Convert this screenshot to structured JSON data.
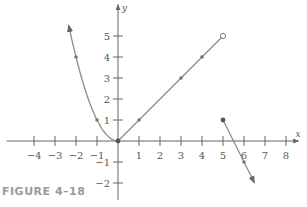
{
  "caption": "FIGURE 4–18",
  "colors": {
    "axis": "#666666",
    "curve": "#8a8a8a",
    "point": "#777777",
    "caption": "#9a9a9a"
  },
  "chart_data": {
    "type": "line",
    "title": "",
    "xlabel": "x",
    "ylabel": "y",
    "xlim": [
      -5.3,
      8.6
    ],
    "ylim": [
      -2.8,
      6.5
    ],
    "grid": false,
    "x_ticks": [
      -4,
      -3,
      -2,
      -1,
      1,
      2,
      3,
      4,
      5,
      6,
      7,
      8
    ],
    "y_ticks": [
      -2,
      -1,
      1,
      2,
      3,
      4,
      5
    ],
    "series": [
      {
        "name": "y = x^2 (x <= 0)",
        "kind": "curve",
        "domain": [
          -2.35,
          0
        ],
        "arrow_start": true,
        "marked_points": [
          [
            -2,
            4
          ],
          [
            -1,
            1
          ]
        ]
      },
      {
        "name": "y = x (0 <= x < 5)",
        "kind": "segment",
        "from": [
          0,
          0
        ],
        "to": [
          5,
          5
        ],
        "end_open": true,
        "marked_points": [
          [
            1,
            1
          ],
          [
            3,
            3
          ],
          [
            4,
            4
          ]
        ]
      },
      {
        "name": "y = -2x + 11 (x >= 5)",
        "kind": "ray",
        "from": [
          5,
          1
        ],
        "to": [
          6.5,
          -2
        ],
        "arrow_end": true,
        "marked_points": [
          [
            5,
            1
          ],
          [
            6,
            -1
          ]
        ]
      }
    ],
    "special_points": [
      {
        "x": 0,
        "y": 0,
        "style": "filled"
      },
      {
        "x": 5,
        "y": 5,
        "style": "open"
      },
      {
        "x": 5,
        "y": 1,
        "style": "filled"
      }
    ]
  }
}
